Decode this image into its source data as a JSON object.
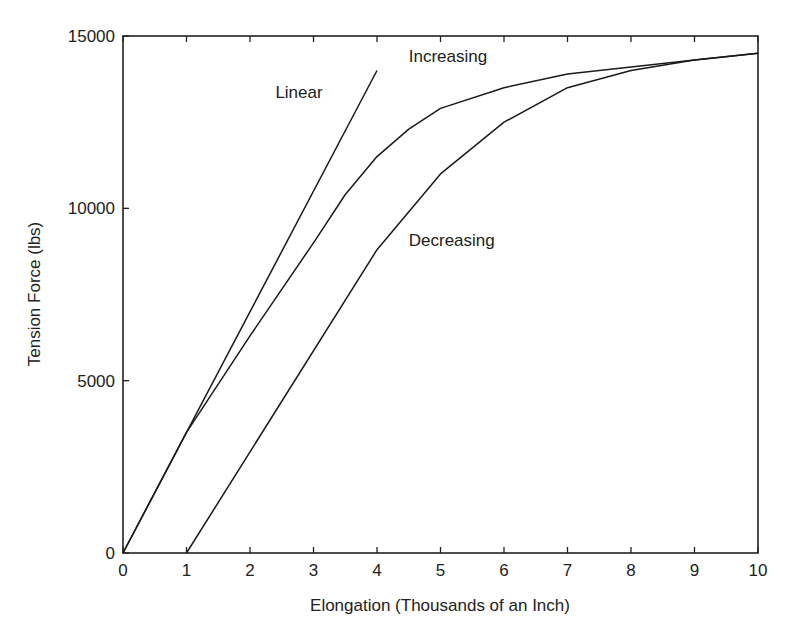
{
  "chart_data": {
    "type": "line",
    "title": "",
    "xlabel": "Elongation (Thousands of an Inch)",
    "ylabel": "Tension Force (lbs)",
    "xlim": [
      0,
      10
    ],
    "ylim": [
      0,
      15000
    ],
    "xticks": [
      0,
      1,
      2,
      3,
      4,
      5,
      6,
      7,
      8,
      9,
      10
    ],
    "yticks": [
      0,
      5000,
      10000,
      15000
    ],
    "grid": false,
    "legend": "inline labels",
    "series": [
      {
        "name": "Linear",
        "x": [
          0,
          4
        ],
        "y": [
          0,
          14000
        ],
        "label_pos": [
          2.4,
          13200
        ]
      },
      {
        "name": "Increasing",
        "x": [
          0,
          1,
          2,
          3,
          3.5,
          4,
          4.5,
          5,
          6,
          7,
          8,
          9,
          10
        ],
        "y": [
          0,
          3500,
          6300,
          9000,
          10400,
          11500,
          12300,
          12900,
          13500,
          13900,
          14100,
          14300,
          14500
        ],
        "label_pos": [
          4.5,
          14250
        ]
      },
      {
        "name": "Decreasing",
        "x": [
          1,
          4,
          5,
          6,
          7,
          8,
          9,
          10
        ],
        "y": [
          0,
          8800,
          11000,
          12500,
          13500,
          14000,
          14300,
          14500
        ],
        "label_pos": [
          4.5,
          8900
        ]
      }
    ]
  }
}
